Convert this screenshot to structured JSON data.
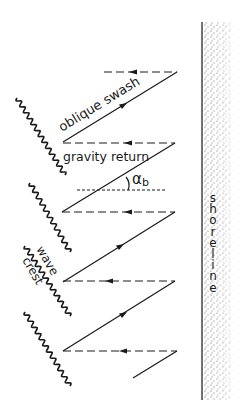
{
  "diagram": {
    "labels": {
      "oblique_swash": "oblique swash",
      "gravity_return": "gravity return",
      "angle": "α",
      "angle_sub": "b",
      "wave": "wave",
      "crest": "crest",
      "shoreline": [
        "s",
        "h",
        "o",
        "r",
        "e",
        "l",
        "i",
        "n",
        "e"
      ]
    },
    "colors": {
      "ink": "#1a1a1a",
      "sand_dots": "#555555",
      "background": "#ffffff"
    }
  }
}
